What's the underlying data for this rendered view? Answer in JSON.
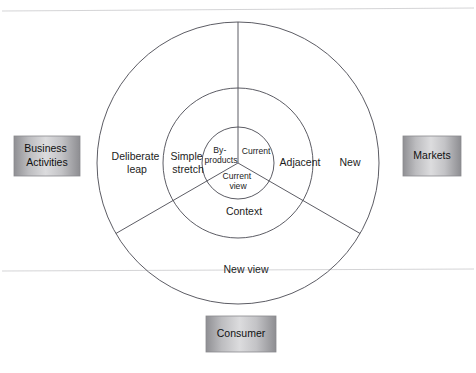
{
  "page": {
    "background_color": "#ffffff",
    "rule_color": "#c9c9cc"
  },
  "diagram": {
    "name": "three-ring-innovation-space-diagram",
    "center": {
      "x": 238,
      "y": 163
    },
    "rings": [
      {
        "id": "inner",
        "radius": 36,
        "fill_color": "#a9a9ad",
        "sectors": [
          {
            "id": "inner-upper-left",
            "label": "By-\nproducts",
            "label_lines": [
              "By-",
              "products"
            ]
          },
          {
            "id": "inner-upper-right",
            "label": "Current",
            "label_lines": [
              "Current"
            ]
          },
          {
            "id": "inner-bottom",
            "label": "Current view",
            "label_lines": [
              "Current",
              "view"
            ]
          }
        ]
      },
      {
        "id": "middle",
        "radius": 75,
        "fill_color_light": "#e4e4e4",
        "fill_color_dark": "#b4b4b6",
        "sectors": [
          {
            "id": "middle-upper-left",
            "label": "Simple stretch",
            "label_lines": [
              "Simple",
              "stretch"
            ]
          },
          {
            "id": "middle-upper-right",
            "label": "Adjacent",
            "label_lines": [
              "Adjacent"
            ]
          },
          {
            "id": "middle-bottom",
            "label": "Context",
            "label_lines": [
              "Context"
            ]
          }
        ]
      },
      {
        "id": "outer",
        "radius": 141,
        "fill_color": "#ffffff",
        "sectors": [
          {
            "id": "outer-upper-left",
            "label": "Deliberate leap",
            "label_lines": [
              "Deliberate",
              "leap"
            ]
          },
          {
            "id": "outer-upper-right",
            "label": "New",
            "label_lines": [
              "New"
            ]
          },
          {
            "id": "outer-bottom",
            "label": "New view",
            "label_lines": [
              "New view"
            ]
          }
        ]
      }
    ],
    "dividers_degrees": [
      90,
      210,
      330
    ]
  },
  "axis_boxes": [
    {
      "id": "business-activities",
      "label": "Business Activities",
      "label_lines": [
        "Business",
        "Activities"
      ],
      "position": "left"
    },
    {
      "id": "markets",
      "label": "Markets",
      "label_lines": [
        "Markets"
      ],
      "position": "right"
    },
    {
      "id": "consumer",
      "label": "Consumer",
      "label_lines": [
        "Consumer"
      ],
      "position": "bottom"
    }
  ]
}
